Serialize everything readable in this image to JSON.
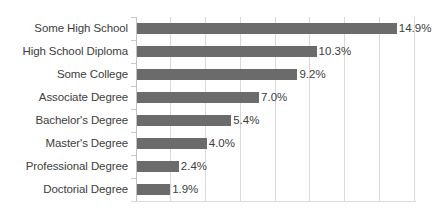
{
  "chart_data": {
    "type": "bar",
    "orientation": "horizontal",
    "title": "",
    "xlabel": "",
    "ylabel": "",
    "categories": [
      "Some High School",
      "High School Diploma",
      "Some College",
      "Associate Degree",
      "Bachelor's Degree",
      "Master's Degree",
      "Professional Degree",
      "Doctorial Degree"
    ],
    "values": [
      14.9,
      10.3,
      9.2,
      7.0,
      5.4,
      4.0,
      2.4,
      1.9
    ],
    "data_labels": [
      "14.9%",
      "10.3%",
      "9.2%",
      "7.0%",
      "5.4%",
      "4.0%",
      "2.4%",
      "1.9%"
    ],
    "xlim": [
      0,
      16
    ],
    "xticks": [
      2,
      4,
      6,
      8,
      10,
      12,
      14,
      16
    ],
    "xtick_labels": [],
    "grid": true,
    "grid_axis": "x",
    "legend": false,
    "bar_color": "#6b6b6b",
    "gridline_color": "#d9d9d9",
    "axis_color": "#c2c2c2",
    "text_color": "#3d3d3d"
  }
}
